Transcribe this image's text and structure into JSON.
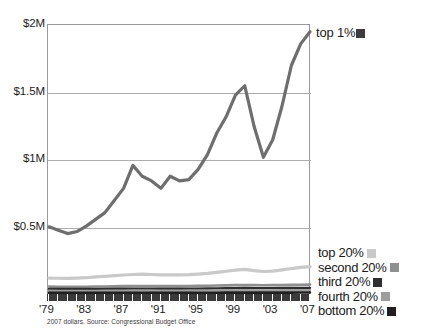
{
  "chart_data": {
    "type": "line",
    "title": "",
    "xlabel": "",
    "ylabel": "",
    "caption": "2007 dollars. Source: Congressional Budget Office",
    "grid": true,
    "legend_position": "right",
    "xlim": [
      1979,
      2007
    ],
    "ylim": [
      0,
      2000000
    ],
    "y_ticks": [
      {
        "value": 2000000,
        "label": "$2M"
      },
      {
        "value": 1500000,
        "label": "$1.5M"
      },
      {
        "value": 1000000,
        "label": "$1M"
      },
      {
        "value": 500000,
        "label": "$0.5M"
      }
    ],
    "x_ticks_labeled": [
      "'79",
      "'83",
      "'87",
      "'91",
      "'95",
      "'99",
      "'03",
      "'07"
    ],
    "x_tick_years_labeled": [
      1979,
      1983,
      1987,
      1991,
      1995,
      1999,
      2003,
      2007
    ],
    "x": [
      1979,
      1980,
      1981,
      1982,
      1983,
      1984,
      1985,
      1986,
      1987,
      1988,
      1989,
      1990,
      1991,
      1992,
      1993,
      1994,
      1995,
      1996,
      1997,
      1998,
      1999,
      2000,
      2001,
      2002,
      2003,
      2004,
      2005,
      2006,
      2007
    ],
    "series": [
      {
        "name": "top 1%",
        "color": "#6e6e6e",
        "values": [
          505000,
          480000,
          455000,
          470000,
          510000,
          560000,
          610000,
          700000,
          790000,
          960000,
          880000,
          845000,
          790000,
          880000,
          845000,
          855000,
          930000,
          1040000,
          1200000,
          1320000,
          1480000,
          1550000,
          1250000,
          1020000,
          1150000,
          1400000,
          1700000,
          1860000,
          1950000
        ],
        "style": "line"
      },
      {
        "name": "top 20%",
        "color": "#c9c9c9",
        "values": [
          125000,
          124000,
          123000,
          125000,
          128000,
          134000,
          138000,
          143000,
          148000,
          152000,
          155000,
          152000,
          149000,
          150000,
          149000,
          151000,
          155000,
          160000,
          168000,
          176000,
          184000,
          190000,
          180000,
          174000,
          177000,
          186000,
          196000,
          204000,
          210000
        ],
        "style": "line"
      },
      {
        "name": "second 20%",
        "color": "#8f8f8f",
        "values": [
          62000,
          61500,
          61000,
          61000,
          61500,
          62500,
          63500,
          64500,
          65500,
          66500,
          67000,
          66500,
          66000,
          66000,
          66000,
          66500,
          67500,
          68500,
          70000,
          71500,
          73000,
          74000,
          73000,
          72500,
          73000,
          74000,
          75000,
          76000,
          77000
        ],
        "style": "line"
      },
      {
        "name": "third 20%",
        "color": "#2e2e2e",
        "values": [
          45000,
          44800,
          44500,
          44300,
          44500,
          45000,
          45500,
          46000,
          46500,
          47000,
          47300,
          47000,
          46800,
          46800,
          46800,
          47000,
          47500,
          48200,
          49000,
          50000,
          51000,
          51500,
          51000,
          50800,
          51000,
          51500,
          52000,
          52500,
          53000
        ],
        "style": "line"
      },
      {
        "name": "fourth 20%",
        "color": "#9d9d9d",
        "values": [
          31000,
          30800,
          30600,
          30400,
          30500,
          30800,
          31000,
          31300,
          31600,
          31900,
          32100,
          32000,
          31800,
          31800,
          31800,
          32000,
          32300,
          32700,
          33200,
          33800,
          34400,
          34800,
          34500,
          34300,
          34400,
          34700,
          35000,
          35400,
          35800
        ],
        "style": "line"
      },
      {
        "name": "bottom 20%",
        "color": "#1f1f1f",
        "values": [
          16000,
          15900,
          15800,
          15700,
          15750,
          15900,
          16000,
          16100,
          16250,
          16400,
          16500,
          16450,
          16350,
          16350,
          16350,
          16450,
          16600,
          16800,
          17050,
          17350,
          17650,
          17850,
          17700,
          17600,
          17650,
          17800,
          17950,
          18150,
          18350
        ],
        "style": "line"
      }
    ]
  },
  "legend_top": {
    "label": "top 1%",
    "color": "#3c3c3c"
  },
  "legend_quintiles": [
    {
      "label": "top 20%",
      "color": "#c9c9c9"
    },
    {
      "label": "second 20%",
      "color": "#8f8f8f"
    },
    {
      "label": "third 20%",
      "color": "#2e2e2e"
    },
    {
      "label": "fourth 20%",
      "color": "#9d9d9d"
    },
    {
      "label": "bottom 20%",
      "color": "#1f1f1f"
    }
  ]
}
